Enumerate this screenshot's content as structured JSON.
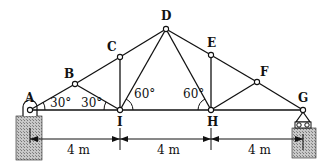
{
  "diagram": {
    "type": "truss",
    "joints": {
      "A": {
        "label": "A",
        "x": 30,
        "y": 110
      },
      "B": {
        "label": "B",
        "x": 75,
        "y": 84
      },
      "C": {
        "label": "C",
        "x": 120,
        "y": 57
      },
      "D": {
        "label": "D",
        "x": 166,
        "y": 29
      },
      "E": {
        "label": "E",
        "x": 211,
        "y": 55
      },
      "F": {
        "label": "F",
        "x": 257,
        "y": 82
      },
      "G": {
        "label": "G",
        "x": 303,
        "y": 110
      },
      "H": {
        "label": "H",
        "x": 211,
        "y": 110
      },
      "I": {
        "label": "I",
        "x": 120,
        "y": 110
      }
    },
    "members": [
      [
        "A",
        "B"
      ],
      [
        "B",
        "C"
      ],
      [
        "C",
        "D"
      ],
      [
        "D",
        "E"
      ],
      [
        "E",
        "F"
      ],
      [
        "F",
        "G"
      ],
      [
        "A",
        "I"
      ],
      [
        "I",
        "H"
      ],
      [
        "H",
        "G"
      ],
      [
        "B",
        "I"
      ],
      [
        "C",
        "I"
      ],
      [
        "D",
        "I"
      ],
      [
        "D",
        "H"
      ],
      [
        "E",
        "H"
      ],
      [
        "F",
        "H"
      ]
    ],
    "angles": [
      {
        "label": "30°",
        "at": "A"
      },
      {
        "label": "30°",
        "at": "I-left"
      },
      {
        "label": "60°",
        "at": "I-right"
      },
      {
        "label": "60°",
        "at": "H-left"
      }
    ],
    "dimensions": [
      {
        "label": "4 m",
        "from": "A",
        "to": "I"
      },
      {
        "label": "4 m",
        "from": "I",
        "to": "H"
      },
      {
        "label": "4 m",
        "from": "H",
        "to": "G"
      }
    ],
    "supports": {
      "left": {
        "joint": "A",
        "type": "pin"
      },
      "right": {
        "joint": "G",
        "type": "roller"
      }
    },
    "colors": {
      "line": "#111111",
      "hatch": "#9a9a9a",
      "background": "#ffffff"
    }
  }
}
